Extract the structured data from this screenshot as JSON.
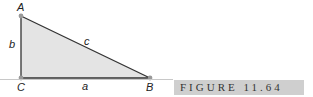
{
  "figure": {
    "label": "FIGURE  11.64",
    "colors": {
      "fill": "#e4e4e4",
      "stroke": "#333333",
      "vertex": "#999999",
      "label_bg": "#cfcfcf"
    }
  },
  "vertices": {
    "A": "A",
    "B": "B",
    "C": "C"
  },
  "sides": {
    "a": "a",
    "b": "b",
    "c": "c"
  }
}
